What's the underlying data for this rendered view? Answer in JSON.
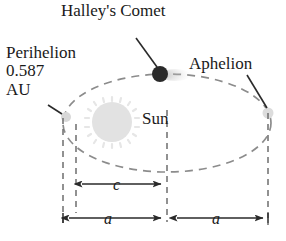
{
  "diagram": {
    "title": "Halley's Comet",
    "labels": {
      "perihelion": "Perihelion\n0.587\nAU",
      "aphelion": "Aphelion",
      "sun": "Sun",
      "focal_distance": "c",
      "semi_major_left": "a",
      "semi_major_right": "a"
    },
    "values": {
      "perihelion_distance": "0.587",
      "perihelion_unit": "AU"
    },
    "colors": {
      "orbit": "#8c8c8c",
      "guide": "#6e6e6e",
      "sun_fill": "#e2e2e2",
      "comet_fill": "#2a2a2a",
      "marker_fill": "#d8d8d8",
      "text": "#1a1a1a",
      "arrow": "#2a2a2a",
      "background": "#ffffff"
    },
    "geometry": {
      "orbit_center_x": 167,
      "orbit_center_y": 123,
      "orbit_radius_x": 104,
      "orbit_radius_y": 49,
      "sun_center_x": 112,
      "sun_center_y": 122,
      "sun_radius": 20,
      "comet_x": 160,
      "comet_y": 74,
      "comet_radius": 8,
      "perihelion_x": 66,
      "perihelion_y": 117,
      "aphelion_x": 268,
      "aphelion_y": 113,
      "guide_left_outer_x": 63,
      "guide_left_inner_x": 76,
      "guide_center_x": 167,
      "guide_right_x": 268,
      "dim_c_y": 184,
      "dim_a_y": 218
    }
  }
}
